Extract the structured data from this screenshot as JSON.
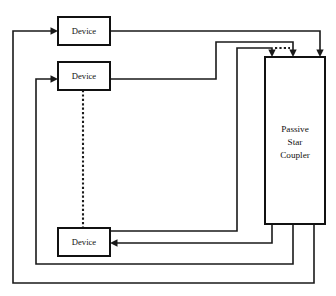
{
  "diagram": {
    "background_color": "#ffffff",
    "line_color": "#1a1a1a",
    "nodes": [
      {
        "id": "device-1",
        "label": "Device",
        "x": 58,
        "y": 17,
        "width": 52,
        "height": 28
      },
      {
        "id": "device-2",
        "label": "Device",
        "x": 58,
        "y": 62,
        "width": 52,
        "height": 28
      },
      {
        "id": "device-3",
        "label": "Device",
        "x": 58,
        "y": 228,
        "width": 52,
        "height": 28
      }
    ],
    "coupler": {
      "id": "passive-star-coupler",
      "x": 265,
      "y": 57,
      "width": 60,
      "height": 167,
      "label_lines": [
        "Passive",
        "Star",
        "Coupler"
      ]
    },
    "ellipsis": {
      "id": "device-ellipsis",
      "orientation": "vertical",
      "x": 83,
      "y_start": 90,
      "y_end": 228
    },
    "coupler_input_arrows": [
      {
        "id": "input-from-device-3",
        "x": 272,
        "y": 57
      },
      {
        "id": "input-from-device-2",
        "x": 293,
        "y": 57
      },
      {
        "id": "input-from-device-1",
        "x": 320,
        "y": 57
      }
    ],
    "coupler_output_ports": [
      {
        "id": "output-to-device-3",
        "x": 272
      },
      {
        "id": "output-to-device-2",
        "x": 293
      },
      {
        "id": "output-to-device-1",
        "x": 314
      }
    ],
    "device_input_arrows": [
      {
        "id": "arrow-into-device-1",
        "x": 58,
        "y": 31
      },
      {
        "id": "arrow-into-device-2",
        "x": 58,
        "y": 79
      },
      {
        "id": "arrow-into-device-3",
        "x": 110,
        "y": 243
      }
    ],
    "wires": [
      {
        "id": "wire-device1-out-to-coupler",
        "path": "M110,31 L320,31 L320,53"
      },
      {
        "id": "wire-device2-out-to-coupler",
        "path": "M110,79 L216,79 L216,42 L293,42 L293,53"
      },
      {
        "id": "wire-device3-out-to-coupler",
        "path": "M110,231 L237,231 L237,48 L272,48 L272,53"
      },
      {
        "id": "wire-coupler-out-to-device3",
        "path": "M272,224 L272,243 L114,243"
      },
      {
        "id": "wire-coupler-out-to-device2",
        "path": "M293,224 L293,264 L36,264 L36,79 L54,79"
      },
      {
        "id": "wire-coupler-out-to-device1",
        "path": "M314,224 L314,283 L13,283 L13,31 L54,31"
      }
    ]
  }
}
